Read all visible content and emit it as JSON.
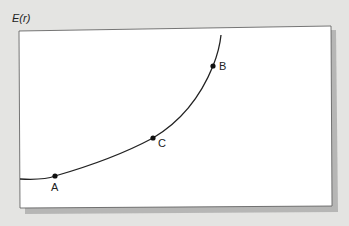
{
  "figure": {
    "y_axis_label": "E(r)",
    "curve": {
      "description": "Convex increasing curve of E(r)",
      "color": "#222222"
    },
    "points": [
      {
        "label": "A",
        "x": 55,
        "y": 176
      },
      {
        "label": "C",
        "x": 153,
        "y": 138
      },
      {
        "label": "B",
        "x": 213,
        "y": 66
      }
    ]
  },
  "colors": {
    "background": "#e4e4e2",
    "card": "#ffffff",
    "shadow": "#9a9a9a",
    "line": "#222222"
  }
}
